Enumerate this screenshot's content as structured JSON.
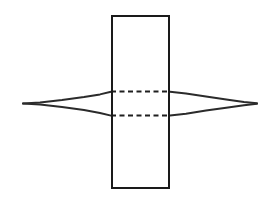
{
  "figure": {
    "background_color": "#ffffff",
    "line_color": "#1a1a1a",
    "hidden_line_color": "#1f1f1f",
    "lens_line_color": "#2b2b2b",
    "canvas": {
      "width": 278,
      "height": 204
    }
  },
  "shapes": {
    "plate": {
      "name": "vertical-rectangle",
      "x": 111,
      "y": 15,
      "width": 59,
      "height": 174,
      "stroke_width": 2,
      "fill": "#ffffff"
    },
    "lens": {
      "name": "horizontal-lens",
      "left_tip_x": 23,
      "left_tip_y": 103,
      "right_tip_x": 257,
      "right_tip_y": 103,
      "top_vertex_y": 91.5,
      "bottom_vertex_y": 115.5,
      "mid_x": 140.5,
      "stroke_width": 2,
      "fill": "#ffffff"
    },
    "hidden_lines": [
      {
        "name": "upper-hidden-line",
        "x1": 111,
        "y1": 91.5,
        "x2": 170,
        "y2": 91.5,
        "dash": "5 3.5"
      },
      {
        "name": "lower-hidden-line",
        "x1": 111,
        "y1": 115.5,
        "x2": 170,
        "y2": 115.5,
        "dash": "5 3.5"
      }
    ]
  },
  "paths": {
    "lens_upper_outline": "M 23 103.5 L 40 102.4 L 62 100.0 L 84 97.0 L 100 94.4 L 111 91.8 L 128 90.6 L 150 90.6 L 170 91.8 L 186 93.6 L 206 96.6 L 228 99.8 L 244 102.0 L 257 103.2",
    "lens_lower_outline": "M 23 103.5 L 40 104.6 L 62 107.0 L 84 110.0 L 100 113.0 L 111 115.6 L 128 116.6 L 150 116.6 L 170 115.6 L 186 113.8 L 206 110.6 L 228 107.4 L 244 105.2 L 257 103.8",
    "lens_left_visible_upper": "M 23 103.5 L 40 102.4 L 62 100.0 L 84 97.0 L 100 94.4 L 111 91.8",
    "lens_left_visible_lower": "M 23 103.5 L 40 104.6 L 62 107.0 L 84 110.0 L 100 113.0 L 111 115.6",
    "lens_right_visible_upper": "M 170 91.8 L 186 93.6 L 206 96.6 L 228 99.8 L 244 102.0 L 257 103.2",
    "lens_right_visible_lower": "M 170 115.6 L 186 113.8 L 206 110.6 L 228 107.4 L 244 105.2 L 257 103.8",
    "plate_outline": "M 112 16 L 169 16 L 169 188 L 112 188 Z"
  },
  "labels": {
    "plate_label": "",
    "lens_label": "",
    "caption": ""
  }
}
